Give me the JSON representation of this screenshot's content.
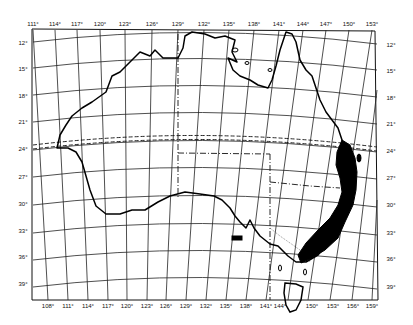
{
  "map": {
    "subject": "Australia",
    "projection_note": "conic graticule, 3 degree spacing",
    "top_longitude_labels": [
      "111°",
      "114°",
      "117°",
      "120°",
      "123°",
      "126°",
      "129°",
      "132°",
      "135°",
      "138°",
      "141°",
      "144°",
      "147°",
      "150°",
      "153°"
    ],
    "bottom_longitude_labels": [
      "108°",
      "111°",
      "114°",
      "117°",
      "120°",
      "123°",
      "126°",
      "129°",
      "132°",
      "135°",
      "138°",
      "141°",
      "144°",
      "150°",
      "153°",
      "156°",
      "159°"
    ],
    "left_latitude_labels": [
      "12°",
      "15°",
      "18°",
      "21°",
      "24°",
      "27°",
      "30°",
      "33°",
      "36°",
      "39°"
    ],
    "right_latitude_labels": [
      "12°",
      "15°",
      "18°",
      "21°",
      "24°",
      "27°",
      "30°",
      "33°",
      "36°",
      "39°"
    ],
    "features": {
      "tropic_of_capricorn": "dashed line at 24°S",
      "state_borders": "dash-dot lines",
      "distribution_area": "solid black fill along eastern coast from ~24°S to ~37°S"
    },
    "colors": {
      "background": "#ffffff",
      "ink": "#111111",
      "distribution_fill": "#000000"
    }
  }
}
